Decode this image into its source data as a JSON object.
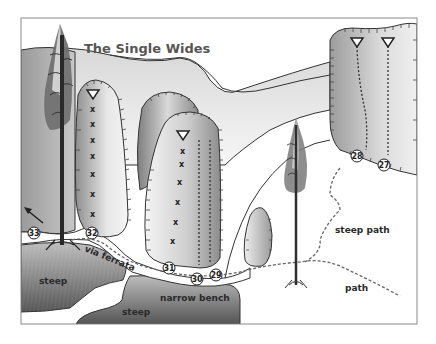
{
  "title": "The Single Wides",
  "colors": {
    "frame": "#8a8a8a",
    "rock_light": "#f2f2f2",
    "rock_dark": "#8c8c8c",
    "ground_dark": "#5a5a5a",
    "line": "#333333",
    "path_dash": "#666666"
  },
  "terrain_labels": {
    "steep_left": "steep",
    "steep_bottom": "steep",
    "narrow_bench": "narrow bench",
    "via_ferrata": "via ferrata",
    "steep_path": "steep path",
    "path": "path"
  },
  "routes": [
    {
      "number": "27",
      "style": "dotted-line",
      "anchor": "rappel-triangle"
    },
    {
      "number": "28",
      "style": "dotted-line",
      "anchor": "rappel-triangle"
    },
    {
      "number": "29",
      "style": "dotted-line",
      "anchor": "none"
    },
    {
      "number": "30",
      "style": "dotted-line",
      "anchor": "rappel-triangle"
    },
    {
      "number": "31",
      "style": "bolt-line",
      "anchor": "rappel-triangle"
    },
    {
      "number": "32",
      "style": "bolt-line",
      "anchor": "rappel-triangle"
    },
    {
      "number": "33",
      "style": "arrow",
      "anchor": "none"
    }
  ],
  "legend_icons": [
    "rappel-anchor-triangle-icon",
    "bolt-x-icon",
    "route-number-circle-icon",
    "tree-icon",
    "arrow-icon"
  ]
}
